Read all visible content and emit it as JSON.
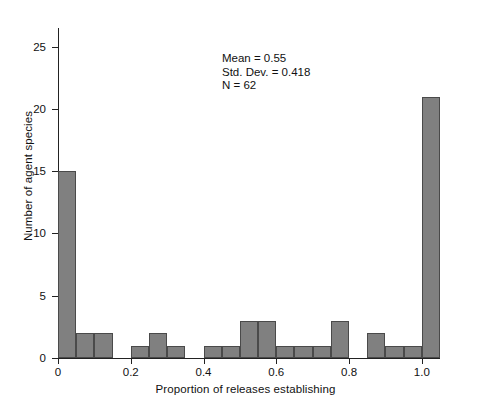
{
  "chart_data": {
    "type": "bar",
    "subtype": "histogram",
    "title": "",
    "xlabel": "Proportion of releases establishing",
    "ylabel": "Number of agent species",
    "xlim": [
      0,
      1.05
    ],
    "ylim": [
      0,
      26.5
    ],
    "bin_width": 0.05,
    "grid": false,
    "legend": null,
    "xticks": [
      {
        "value": 0,
        "label": "0"
      },
      {
        "value": 0.2,
        "label": "0.2"
      },
      {
        "value": 0.4,
        "label": "0.4"
      },
      {
        "value": 0.6,
        "label": "0.6"
      },
      {
        "value": 0.8,
        "label": "0.8"
      },
      {
        "value": 1.0,
        "label": "1.0"
      }
    ],
    "yticks": [
      {
        "value": 0,
        "label": "0"
      },
      {
        "value": 5,
        "label": "5"
      },
      {
        "value": 10,
        "label": "10"
      },
      {
        "value": 15,
        "label": "15"
      },
      {
        "value": 20,
        "label": "20"
      },
      {
        "value": 25,
        "label": "25"
      }
    ],
    "bin_edges": [
      0.0,
      0.05,
      0.1,
      0.15,
      0.2,
      0.25,
      0.3,
      0.35,
      0.4,
      0.45,
      0.5,
      0.55,
      0.6,
      0.65,
      0.7,
      0.75,
      0.8,
      0.85,
      0.9,
      0.95,
      1.0,
      1.05
    ],
    "categories": [
      "0.00-0.05",
      "0.05-0.10",
      "0.10-0.15",
      "0.15-0.20",
      "0.20-0.25",
      "0.25-0.30",
      "0.30-0.35",
      "0.35-0.40",
      "0.40-0.45",
      "0.45-0.50",
      "0.50-0.55",
      "0.55-0.60",
      "0.60-0.65",
      "0.65-0.70",
      "0.70-0.75",
      "0.75-0.80",
      "0.80-0.85",
      "0.85-0.90",
      "0.90-0.95",
      "0.95-1.00",
      "1.00-1.05"
    ],
    "values": [
      15,
      2,
      2,
      0,
      1,
      2,
      1,
      0,
      1,
      1,
      3,
      3,
      1,
      1,
      1,
      3,
      0,
      2,
      1,
      1,
      21
    ],
    "bar_color": "#808080",
    "bar_edge_color": "#4a4a4a",
    "annotations": [
      "Mean = 0.55",
      "Std. Dev. = 0.418",
      "N = 62"
    ],
    "statistics": {
      "mean": 0.55,
      "std_dev": 0.418,
      "n": 62
    }
  }
}
